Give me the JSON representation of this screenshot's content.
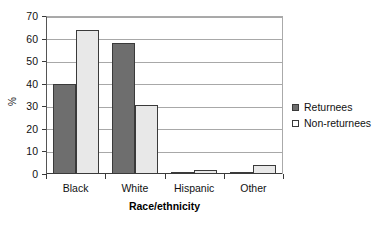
{
  "chart_data": {
    "type": "bar",
    "title": "",
    "xlabel": "Race/ethnicity",
    "ylabel": "%",
    "categories": [
      "Black",
      "White",
      "Hispanic",
      "Other"
    ],
    "series": [
      {
        "name": "Returnees",
        "color": "#6e6e6e",
        "values": [
          40,
          58,
          1,
          0.5
        ]
      },
      {
        "name": "Non-returnees",
        "color": "#e8e8e8",
        "values": [
          64,
          30.5,
          2,
          4
        ]
      }
    ],
    "ylim": [
      0,
      70
    ],
    "ytick_step": 10,
    "yticks": [
      70,
      60,
      50,
      40,
      30,
      20,
      10,
      0
    ],
    "grid": true,
    "legend_position": "right"
  }
}
